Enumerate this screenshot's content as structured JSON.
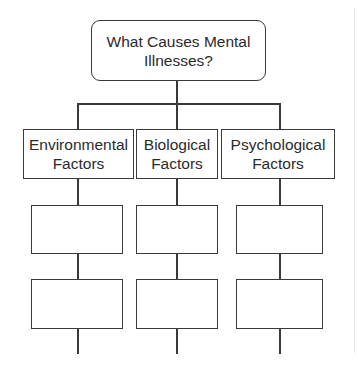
{
  "diagram": {
    "root": {
      "line1": "What Causes Mental",
      "line2": "Illnesses?"
    },
    "categories": [
      {
        "line1": "Environmental",
        "line2": "Factors"
      },
      {
        "line1": "Biological",
        "line2": "Factors"
      },
      {
        "line1": "Psychological",
        "line2": "Factors"
      }
    ],
    "blank_boxes_per_category": 2,
    "colors": {
      "stroke": "#3a3a3a",
      "background": "#ffffff",
      "text": "#2b2b2b"
    }
  }
}
